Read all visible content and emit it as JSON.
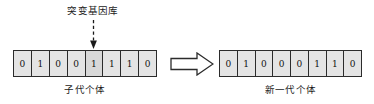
{
  "diagram": {
    "mutation_pointer": {
      "label": "突变基因库",
      "target_gene_index": 4,
      "arrow_style": "dashed-down-arrow"
    },
    "transform_arrow": {
      "icon": "block-right-arrow"
    },
    "parent": {
      "caption": "子代个体",
      "genes": [
        "0",
        "1",
        "0",
        "0",
        "1",
        "1",
        "1",
        "0"
      ]
    },
    "offspring": {
      "caption": "新一代个体",
      "genes": [
        "0",
        "1",
        "0",
        "0",
        "0",
        "1",
        "1",
        "0"
      ]
    },
    "colors": {
      "stroke": "#2b2b2b",
      "gene_fill": "#e4e4e4",
      "mutated_fill": "#d8d8d8",
      "background": "#ffffff",
      "text": "#1a1a1a"
    }
  }
}
